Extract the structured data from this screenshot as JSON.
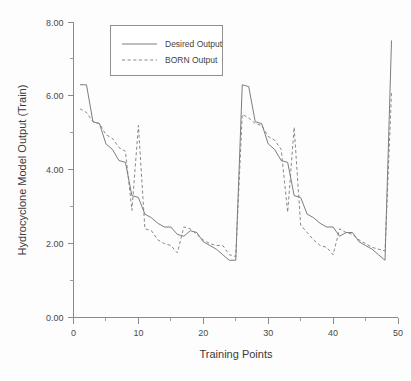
{
  "chart_data": {
    "type": "line",
    "title": "",
    "xlabel": "Training Points",
    "ylabel": "Hydrocyclone Model Output (Train)",
    "xlim": [
      0,
      50
    ],
    "ylim": [
      0.0,
      8.0
    ],
    "x_major_ticks": [
      0,
      10,
      20,
      30,
      40,
      50
    ],
    "x_minor_ticks": [
      5,
      15,
      25,
      35,
      45
    ],
    "y_major_ticks": [
      0.0,
      2.0,
      4.0,
      6.0,
      8.0
    ],
    "y_minor_ticks": [
      1.0,
      3.0,
      5.0,
      7.0
    ],
    "x_tick_labels": [
      "0",
      "10",
      "20",
      "30",
      "40",
      "50"
    ],
    "y_tick_labels": [
      "0.00",
      "2.00",
      "4.00",
      "6.00",
      "8.00"
    ],
    "grid": false,
    "legend_position": "top-center",
    "x": [
      1,
      2,
      3,
      4,
      5,
      6,
      7,
      8,
      9,
      10,
      11,
      12,
      13,
      14,
      15,
      16,
      17,
      18,
      19,
      20,
      21,
      22,
      23,
      24,
      25,
      26,
      27,
      28,
      29,
      30,
      31,
      32,
      33,
      34,
      35,
      36,
      37,
      38,
      39,
      40,
      41,
      42,
      43,
      44,
      45,
      46,
      47,
      48,
      49
    ],
    "series": [
      {
        "name": "Desired Output",
        "style": "solid",
        "color": "#6e6e6e",
        "values": [
          6.3,
          6.3,
          5.3,
          5.25,
          4.7,
          4.55,
          4.25,
          4.2,
          3.3,
          3.25,
          2.8,
          2.7,
          2.55,
          2.45,
          2.45,
          2.25,
          2.2,
          2.35,
          2.3,
          2.05,
          1.95,
          1.85,
          1.7,
          1.55,
          1.55,
          6.3,
          6.25,
          5.3,
          5.25,
          4.7,
          4.55,
          4.25,
          4.2,
          3.3,
          3.25,
          2.8,
          2.7,
          2.55,
          2.45,
          2.45,
          2.2,
          2.3,
          2.3,
          2.05,
          1.95,
          1.85,
          1.7,
          1.55,
          7.5
        ]
      },
      {
        "name": "BORN Output",
        "style": "dashed",
        "color": "#7d7d7d",
        "values": [
          5.65,
          5.55,
          5.3,
          5.25,
          4.95,
          4.85,
          4.6,
          4.5,
          2.9,
          5.2,
          2.4,
          2.35,
          2.1,
          2.0,
          1.95,
          1.75,
          2.45,
          2.4,
          2.25,
          2.1,
          2.0,
          1.95,
          1.95,
          1.7,
          1.65,
          5.5,
          5.4,
          5.25,
          5.2,
          4.9,
          4.8,
          4.55,
          2.85,
          5.15,
          2.5,
          2.3,
          2.1,
          1.95,
          1.9,
          1.7,
          2.4,
          2.3,
          2.25,
          2.1,
          2.0,
          1.9,
          1.85,
          1.8,
          6.1
        ]
      }
    ]
  },
  "legend": {
    "entries": [
      {
        "label": "Desired Output"
      },
      {
        "label": "BORN Output"
      }
    ]
  },
  "axes": {
    "y_title": "Hydrocyclone Model Output (Train)",
    "x_title": "Training Points"
  }
}
